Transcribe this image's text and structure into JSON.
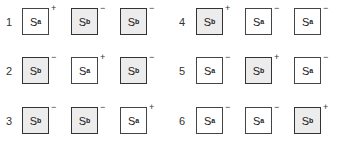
{
  "groups": [
    {
      "label": "1",
      "boxes": [
        {
          "state": "S",
          "sub": "a",
          "shaded": false,
          "sign": "+"
        },
        {
          "state": "S",
          "sub": "b",
          "shaded": true,
          "sign": "−"
        },
        {
          "state": "S",
          "sub": "b",
          "shaded": true,
          "sign": "−"
        }
      ]
    },
    {
      "label": "2",
      "boxes": [
        {
          "state": "S",
          "sub": "b",
          "shaded": true,
          "sign": "−"
        },
        {
          "state": "S",
          "sub": "a",
          "shaded": false,
          "sign": "+"
        },
        {
          "state": "S",
          "sub": "b",
          "shaded": true,
          "sign": "−"
        }
      ]
    },
    {
      "label": "3",
      "boxes": [
        {
          "state": "S",
          "sub": "b",
          "shaded": true,
          "sign": "−"
        },
        {
          "state": "S",
          "sub": "b",
          "shaded": true,
          "sign": "−"
        },
        {
          "state": "S",
          "sub": "a",
          "shaded": false,
          "sign": "+"
        }
      ]
    },
    {
      "label": "4",
      "boxes": [
        {
          "state": "S",
          "sub": "b",
          "shaded": true,
          "sign": "+"
        },
        {
          "state": "S",
          "sub": "a",
          "shaded": false,
          "sign": "−"
        },
        {
          "state": "S",
          "sub": "a",
          "shaded": false,
          "sign": "−"
        }
      ]
    },
    {
      "label": "5",
      "boxes": [
        {
          "state": "S",
          "sub": "a",
          "shaded": false,
          "sign": "−"
        },
        {
          "state": "S",
          "sub": "b",
          "shaded": true,
          "sign": "+"
        },
        {
          "state": "S",
          "sub": "a",
          "shaded": false,
          "sign": "−"
        }
      ]
    },
    {
      "label": "6",
      "boxes": [
        {
          "state": "S",
          "sub": "a",
          "shaded": false,
          "sign": "−"
        },
        {
          "state": "S",
          "sub": "a",
          "shaded": false,
          "sign": "−"
        },
        {
          "state": "S",
          "sub": "b",
          "shaded": true,
          "sign": "+"
        }
      ]
    }
  ]
}
